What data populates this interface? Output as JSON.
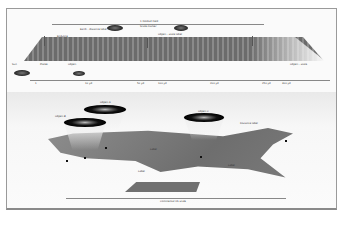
{
  "field_section": {
    "top_bracket_label": "1 football field",
    "callouts": [
      {
        "id": "c1",
        "text": "Earth - distance label"
      },
      {
        "id": "c2",
        "text": "Scale marker"
      },
      {
        "id": "c3",
        "text": "Object - scale label"
      },
      {
        "id": "c4",
        "text": "Endzone"
      }
    ],
    "bottom_labels": [
      {
        "id": "b1",
        "text": "Sun"
      },
      {
        "id": "b2",
        "text": "Planet"
      },
      {
        "id": "b3",
        "text": "Object"
      },
      {
        "id": "b4",
        "text": "Object - scale"
      }
    ],
    "axis_ticks": [
      "1",
      "10 yd",
      "50 yd",
      "100 yd",
      "200 yd",
      "250 yd",
      "300 yd"
    ]
  },
  "map_section": {
    "ring_labels": [
      "Object A",
      "Object B",
      "Object C"
    ],
    "annotations": [
      "Label",
      "City",
      "City",
      "City",
      "City",
      "Label",
      "Label",
      "Distance label"
    ],
    "bottom_bracket_label": "Continental US scale"
  }
}
